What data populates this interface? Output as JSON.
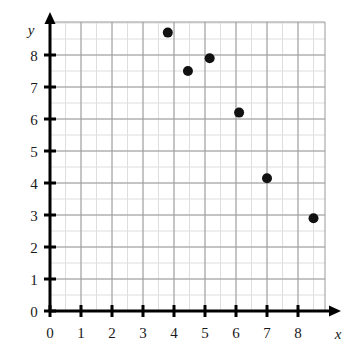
{
  "chart_data": {
    "type": "scatter",
    "title": "",
    "subtitle": "",
    "xlabel": "x",
    "ylabel": "y",
    "xlim": [
      0,
      8.9
    ],
    "ylim": [
      0,
      9.0
    ],
    "xticks": [
      0,
      1,
      2,
      3,
      4,
      5,
      6,
      7,
      8
    ],
    "yticks": [
      0,
      1,
      2,
      3,
      4,
      5,
      6,
      7,
      8
    ],
    "xtick_labels": [
      "0",
      "1",
      "2",
      "3",
      "4",
      "5",
      "6",
      "7",
      "8"
    ],
    "ytick_labels": [
      "0",
      "1",
      "2",
      "3",
      "4",
      "5",
      "6",
      "7",
      "8"
    ],
    "grid": true,
    "grid_minor_step": 0.5,
    "legend": null,
    "legend_position": "none",
    "marker": "filled-circle",
    "marker_color": "#111111",
    "marker_size": 5,
    "points": [
      {
        "x": 3.8,
        "y": 8.7
      },
      {
        "x": 4.45,
        "y": 7.5
      },
      {
        "x": 5.15,
        "y": 7.9
      },
      {
        "x": 6.1,
        "y": 6.2
      },
      {
        "x": 7.0,
        "y": 4.15
      },
      {
        "x": 8.5,
        "y": 2.9
      }
    ],
    "colors": {
      "axis": "#000000",
      "grid_major": "#9a9a9a",
      "grid_minor": "#dedede",
      "text": "#1a1a1a",
      "background": "#ffffff"
    }
  }
}
